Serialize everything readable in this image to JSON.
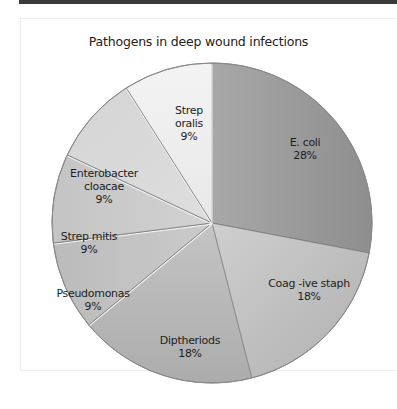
{
  "chart_data": {
    "type": "pie",
    "title": "Pathogens in deep wound infections",
    "categories": [
      "E. coli",
      "Coag -ive staph",
      "Diptheriods",
      "Pseudomonas",
      "Strep mitis",
      "Enterobacter cloacae",
      "Strep oralis"
    ],
    "values": [
      28,
      18,
      18,
      9,
      9,
      9,
      9
    ],
    "labels": [
      "28%",
      "18%",
      "18%",
      "9%",
      "9%",
      "9%",
      "9%"
    ],
    "start_angle": "12 o'clock",
    "direction": "clockwise",
    "colors": [
      "#9a9a9a",
      "#bdbdbd",
      "#b3b3b3",
      "#c2c2c2",
      "#cacaca",
      "#dadada",
      "#ededed"
    ],
    "legend": "none (labels inside slices)"
  },
  "labels": {
    "title": "Pathogens in deep wound infections",
    "slices": [
      {
        "name_lines": [
          "E. coli"
        ],
        "pct": "28%"
      },
      {
        "name_lines": [
          "Coag -ive staph"
        ],
        "pct": "18%"
      },
      {
        "name_lines": [
          "Diptheriods"
        ],
        "pct": "18%"
      },
      {
        "name_lines": [
          "Pseudomonas"
        ],
        "pct": "9%"
      },
      {
        "name_lines": [
          "Strep mitis"
        ],
        "pct": "9%"
      },
      {
        "name_lines": [
          "Enterobacter",
          "cloacae"
        ],
        "pct": "9%"
      },
      {
        "name_lines": [
          "Strep",
          "oralis"
        ],
        "pct": "9%"
      }
    ]
  }
}
